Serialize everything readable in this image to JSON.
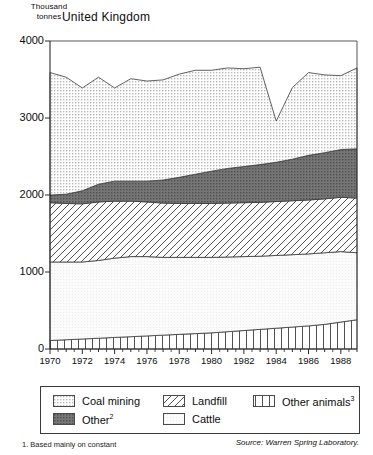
{
  "axis_unit_line1": "Thousand",
  "axis_unit_line2": "tonnes",
  "title": "United Kingdom",
  "footnote": "1. Based mainly on constant",
  "source": "Source: Warren Spring Laboratory.",
  "legend": {
    "items": [
      {
        "label": "Coal mining",
        "sup": "",
        "pattern": "stipple-light",
        "name": "legend-coal-mining"
      },
      {
        "label": "Other",
        "sup": "2",
        "pattern": "stipple-dark",
        "name": "legend-other"
      },
      {
        "label": "Landfill",
        "sup": "",
        "pattern": "diagonal",
        "name": "legend-landfill"
      },
      {
        "label": "Cattle",
        "sup": "",
        "pattern": "plain-light",
        "name": "legend-cattle"
      },
      {
        "label": "Other animals",
        "sup": "3",
        "pattern": "vertical",
        "name": "legend-other-animals"
      }
    ]
  },
  "chart_data": {
    "type": "area",
    "title": "United Kingdom",
    "subtitle": "",
    "xlabel": "",
    "ylabel": "Thousand tonnes",
    "ylim": [
      0,
      4000
    ],
    "yticks": [
      0,
      1000,
      2000,
      3000,
      4000
    ],
    "xlim": [
      1970,
      1989
    ],
    "xticks": [
      1970,
      1972,
      1974,
      1976,
      1978,
      1980,
      1982,
      1984,
      1986,
      1988
    ],
    "x_tick_labels": [
      "1970",
      "1972",
      "1974",
      "1976",
      "1978",
      "1980",
      "1982",
      "1984",
      "1986",
      "1988"
    ],
    "x_minor_tick_step": 1,
    "grid": false,
    "legend_position": "below-plot",
    "stacked": true,
    "stack_order_bottom_to_top": [
      "Other animals",
      "Cattle",
      "Landfill",
      "Other",
      "Coal mining"
    ],
    "x": [
      1970,
      1971,
      1972,
      1973,
      1974,
      1975,
      1976,
      1977,
      1978,
      1979,
      1980,
      1981,
      1982,
      1983,
      1984,
      1985,
      1986,
      1987,
      1988,
      1989
    ],
    "series": [
      {
        "name": "Other animals",
        "color": "#ffffff",
        "pattern": "vertical",
        "values": [
          110,
          120,
          130,
          140,
          150,
          160,
          170,
          180,
          190,
          200,
          210,
          225,
          240,
          255,
          270,
          285,
          300,
          320,
          350,
          380
        ]
      },
      {
        "name": "Cattle",
        "color": "#f2f2f2",
        "pattern": "plain-light",
        "values": [
          1020,
          1010,
          1000,
          1010,
          1030,
          1040,
          1030,
          1010,
          1000,
          990,
          980,
          970,
          960,
          950,
          945,
          940,
          935,
          930,
          915,
          870
        ]
      },
      {
        "name": "Landfill",
        "color": "#ffffff",
        "pattern": "diagonal",
        "values": [
          770,
          760,
          755,
          760,
          740,
          720,
          710,
          705,
          700,
          700,
          700,
          700,
          700,
          700,
          700,
          700,
          700,
          700,
          705,
          710
        ]
      },
      {
        "name": "Other",
        "color": "#7d7d7d",
        "pattern": "stipple-dark",
        "values": [
          100,
          120,
          170,
          230,
          260,
          260,
          270,
          300,
          340,
          380,
          420,
          450,
          470,
          490,
          510,
          540,
          580,
          600,
          620,
          640
        ]
      },
      {
        "name": "Coal mining",
        "color": "#dcdcdc",
        "pattern": "stipple-light",
        "values": [
          1590,
          1520,
          1335,
          1390,
          1210,
          1330,
          1300,
          1300,
          1340,
          1350,
          1310,
          1305,
          1270,
          1265,
          535,
          930,
          1075,
          1010,
          960,
          1050
        ]
      }
    ],
    "totals": [
      3590,
      3530,
      3390,
      3530,
      3390,
      3510,
      3480,
      3495,
      3570,
      3620,
      3620,
      3650,
      3640,
      3660,
      2960,
      3395,
      3590,
      3560,
      3550,
      3650
    ],
    "annotations": [
      {
        "x": 1984,
        "text": "sharp dip in coal mining",
        "value": 2960
      }
    ]
  }
}
